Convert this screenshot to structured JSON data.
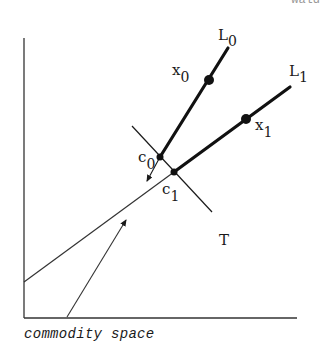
{
  "header_fragment": "wald",
  "caption": "commodity space",
  "labels": {
    "L0": "L",
    "L0_sub": "0",
    "L1": "L",
    "L1_sub": "1",
    "x0": "x",
    "x0_sub": "0",
    "x1": "x",
    "x1_sub": "1",
    "c0": "c",
    "c0_sub": "0",
    "c1": "c",
    "c1_sub": "1",
    "T": "T"
  },
  "colors": {
    "ink": "#1a1a1a",
    "background": "#ffffff"
  }
}
